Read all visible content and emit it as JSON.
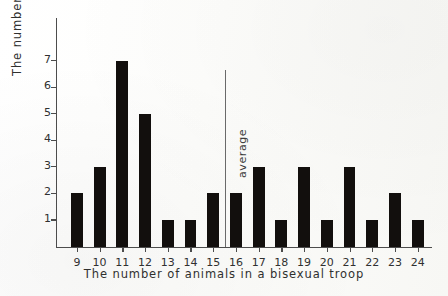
{
  "chart_data": {
    "type": "bar",
    "title": "",
    "xlabel": "The number  of  animals in a  bisexual troop",
    "ylabel": "The number  of  troops",
    "categories": [
      "9",
      "10",
      "11",
      "12",
      "13",
      "14",
      "15",
      "16",
      "17",
      "18",
      "19",
      "20",
      "21",
      "22",
      "23",
      "24"
    ],
    "values": [
      2,
      3,
      7,
      5,
      1,
      1,
      2,
      2,
      3,
      1,
      3,
      1,
      3,
      1,
      2,
      1
    ],
    "ytick_labels": [
      "1",
      "2",
      "3",
      "4",
      "5",
      "6",
      "7"
    ],
    "ytick_values": [
      1,
      2,
      3,
      4,
      5,
      6,
      7
    ],
    "ylim": [
      0,
      8.6
    ],
    "xlim_categories": 16,
    "grid": false,
    "legend": false,
    "annotations": [
      {
        "name": "average",
        "label": "average",
        "orientation": "vertical-line",
        "x_category_position": 15.5
      }
    ],
    "colors": {
      "bar": "#120f0d",
      "axis": "#4c4c4c",
      "text": "#303030",
      "average_line": "#6a6a6a",
      "background": "#fbfbf9"
    }
  }
}
